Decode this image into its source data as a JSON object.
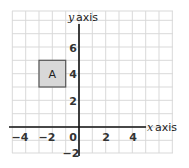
{
  "diagram": {
    "type": "coordinate-grid",
    "x_axis_label": "x axis",
    "x_axis_var": "x",
    "x_axis_word": "axis",
    "y_axis_var": "y",
    "y_axis_word": "axis",
    "x_ticks": [
      "−4",
      "−2",
      "0",
      "2",
      "4"
    ],
    "y_ticks": [
      "6",
      "4",
      "2",
      "−2"
    ],
    "shape": {
      "label": "A",
      "x_range": [
        -3,
        -1
      ],
      "y_range": [
        3,
        5
      ],
      "fill": "#d8d8d8",
      "stroke": "#555555"
    },
    "grid_range": {
      "x": [
        -5,
        7
      ],
      "y": [
        -2,
        8.7
      ]
    }
  }
}
